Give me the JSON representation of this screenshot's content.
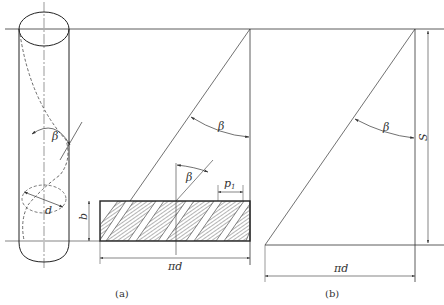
{
  "figure": {
    "panels": [
      {
        "id": "a",
        "caption": "(a)",
        "labels": {
          "helix_angle": "β",
          "diameter": "d",
          "strip_width": "b",
          "pitch": "p",
          "pitch_subscript": "1",
          "unrolled_length": "πd",
          "angle_in_strip": "β",
          "angle_top": "β"
        }
      },
      {
        "id": "b",
        "caption": "(b)",
        "labels": {
          "helix_angle": "β",
          "lead": "S",
          "unrolled_length": "πd"
        }
      }
    ],
    "colors": {
      "line": "#333333",
      "hatch": "#444444",
      "background": "#ffffff"
    }
  }
}
